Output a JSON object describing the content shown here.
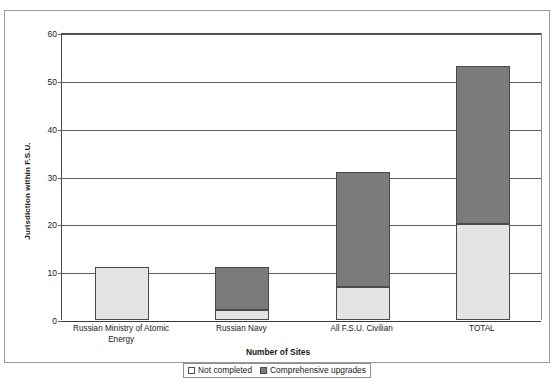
{
  "chart_data": {
    "type": "bar",
    "subtype": "stacked",
    "title": "",
    "xlabel": "Number of Sites",
    "ylabel": "Jurisdiction within F.S.U.",
    "categories": [
      "Russian Ministry of Atomic Energy",
      "Russian Navy",
      "All F.S.U. Civilian",
      "TOTAL"
    ],
    "series": [
      {
        "name": "Not completed",
        "color": "#e4e4e4",
        "values": [
          11,
          2,
          7,
          20
        ]
      },
      {
        "name": "Comprehensive upgrades",
        "color": "#7b7b7b",
        "values": [
          0,
          9,
          24,
          33
        ]
      }
    ],
    "totals": [
      11,
      11,
      31,
      53
    ],
    "ylim": [
      0,
      60
    ],
    "ytick_labels": [
      "60",
      "50",
      "40",
      "30",
      "20",
      "10",
      "0"
    ],
    "ytick_values": [
      60,
      50,
      40,
      30,
      20,
      10,
      0
    ],
    "grid": true,
    "legend_position": "bottom"
  },
  "axis": {
    "y_title": "Jurisdiction within F.S.U.",
    "x_title": "Number of Sites"
  },
  "categories_display": [
    {
      "line1": "Russian Ministry of Atomic",
      "line2": "Energy"
    },
    {
      "line1": "Russian Navy",
      "line2": ""
    },
    {
      "line1": "All F.S.U. Civilian",
      "line2": ""
    },
    {
      "line1": "TOTAL",
      "line2": ""
    }
  ],
  "legend": {
    "items": [
      {
        "label": "Not completed",
        "swatch": "not-completed-swatch"
      },
      {
        "label": "Comprehensive upgrades",
        "swatch": "comprehensive-upgrades-swatch"
      }
    ]
  }
}
